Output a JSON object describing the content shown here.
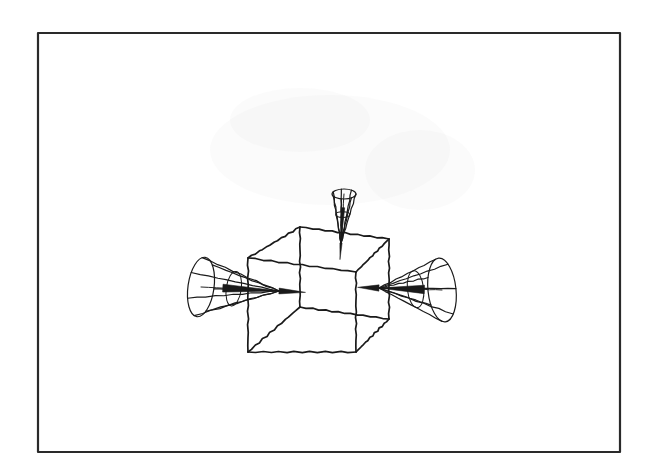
{
  "figure": {
    "kind": "line-drawing",
    "background_color": "#ffffff",
    "ink_color": "#1a1a1a",
    "frame": {
      "name": "outer-border",
      "x": 38,
      "y": 33,
      "width": 582,
      "height": 419,
      "stroke_width": 2.2,
      "stroke_color": "#2a2a2a",
      "fill_color": "#ffffff"
    },
    "cube": {
      "name": "wireframe-cube",
      "stroke_width": 1.7,
      "stroke_color": "#1a1a1a",
      "vertices": {
        "front_top_left": [
          248,
          258
        ],
        "front_top_right": [
          356,
          272
        ],
        "front_bottom_right": [
          356,
          352
        ],
        "front_bottom_left": [
          248,
          352
        ],
        "back_top_left": [
          300,
          227
        ],
        "back_top_right": [
          389,
          239
        ],
        "back_bottom_right": [
          389,
          319
        ],
        "back_bottom_left": [
          300,
          307
        ]
      },
      "edge_count": 12,
      "visible_style": "transparent wireframe, all 12 edges drawn"
    },
    "cones": [
      {
        "name": "cone-top",
        "label": "top cone",
        "direction": "downward",
        "apex": [
          341,
          243
        ],
        "base_center": [
          344,
          194
        ],
        "base_rx": 12,
        "base_ry": 5,
        "base_tilt_deg": 0,
        "ribs": 7,
        "stroke_width": 1.2,
        "penetrates_face": "top"
      },
      {
        "name": "cone-left",
        "label": "left cone",
        "direction": "rightward",
        "apex": [
          279,
          291
        ],
        "base_center": [
          201,
          287
        ],
        "base_rx": 13,
        "base_ry": 30,
        "base_tilt_deg": 8,
        "ribs": 7,
        "stroke_width": 1.2,
        "penetrates_face": "left"
      },
      {
        "name": "cone-right",
        "label": "right cone",
        "direction": "leftward",
        "apex": [
          379,
          288
        ],
        "base_center": [
          442,
          290
        ],
        "base_rx": 14,
        "base_ry": 32,
        "base_tilt_deg": -6,
        "ribs": 7,
        "stroke_width": 1.2,
        "penetrates_face": "right"
      }
    ]
  }
}
